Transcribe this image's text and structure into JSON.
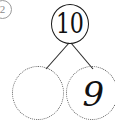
{
  "diagram": {
    "type": "number-bond",
    "question_marker": "2",
    "total": {
      "label": "10",
      "border_style": "solid",
      "filled": true
    },
    "parts": [
      {
        "label": "",
        "border_style": "dotted",
        "filled": false,
        "position": "left"
      },
      {
        "label": "9",
        "border_style": "dotted",
        "filled": true,
        "position": "right"
      }
    ],
    "connectors": [
      {
        "from": "total",
        "to": "part-left"
      },
      {
        "from": "total",
        "to": "part-right"
      }
    ],
    "colors": {
      "ink": "#1a1a1a",
      "dotted_outline": "#5b5b5b",
      "marker": "#8a8a8a",
      "background": "#ffffff"
    }
  }
}
